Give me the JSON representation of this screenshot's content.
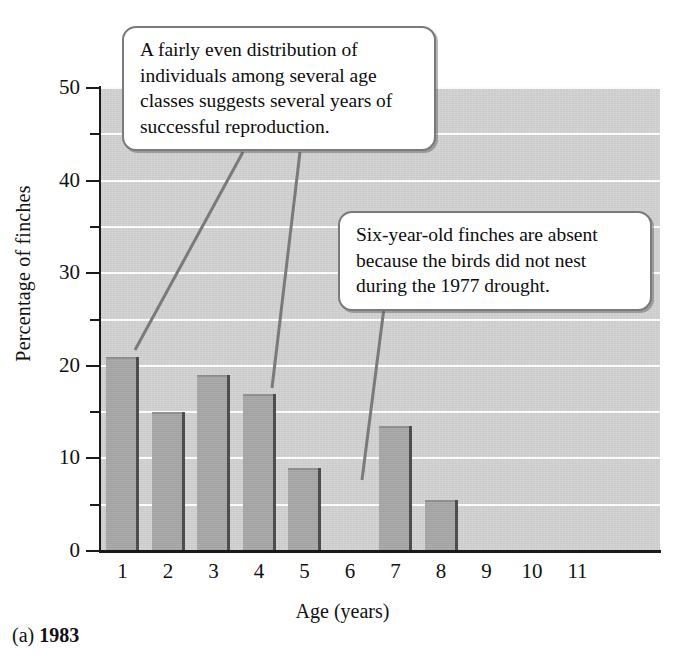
{
  "figure": {
    "caption_prefix": "(a)",
    "caption_year": "1983"
  },
  "chart_data": {
    "type": "bar",
    "title": "",
    "subtitle": "",
    "xlabel": "Age (years)",
    "ylabel": "Percentage of finches",
    "categories": [
      "1",
      "2",
      "3",
      "4",
      "5",
      "6",
      "7",
      "8",
      "9",
      "10",
      "11"
    ],
    "values": [
      21,
      15,
      19,
      17,
      9,
      0,
      13.5,
      5.5,
      0,
      0,
      0
    ],
    "ylim": [
      0,
      50
    ],
    "xlim_categories": 11,
    "ymajor_ticks": [
      0,
      10,
      20,
      30,
      40,
      50
    ],
    "yminor_ticks": [
      5,
      15,
      25,
      35,
      45
    ],
    "ytick_labels": [
      "0",
      "10",
      "20",
      "30",
      "40",
      "50"
    ],
    "grid": "horizontal-white-every-5",
    "legend": "none",
    "series": [
      {
        "name": "Percentage of finches",
        "values": [
          21,
          15,
          19,
          17,
          9,
          0,
          13.5,
          5.5,
          0,
          0,
          0
        ]
      }
    ],
    "annotations": [
      {
        "id": "callout-1",
        "text": "A fairly even distribution of individuals among several age classes suggests several years of successful reproduction.",
        "points_to": [
          "1",
          "4"
        ]
      },
      {
        "id": "callout-2",
        "text": "Six-year-old finches are absent because the birds did not nest during the 1977 drought.",
        "points_to": [
          "6"
        ]
      }
    ],
    "colors": {
      "plot_background": "#d3d3d3",
      "gridline": "#fbfbfb",
      "bar_fill": "#a8a8a8",
      "bar_shadow": "#4a4a4a",
      "axis": "#1a1a1a",
      "callout_border": "#7a7a7a",
      "callout_background": "#ffffff",
      "leader_line": "#7a7a7a",
      "page_background": "#ffffff"
    }
  }
}
